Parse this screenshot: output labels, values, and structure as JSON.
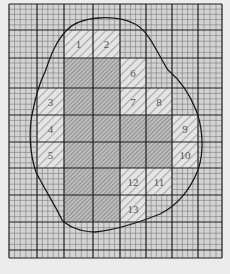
{
  "figure": {
    "grid": {
      "left": 9,
      "top": 4,
      "right": 222,
      "bottom": 258,
      "columns_x": [
        9,
        37,
        64,
        93,
        120,
        146,
        172,
        198,
        222
      ],
      "rows_y": [
        4,
        30,
        58,
        88,
        115,
        142,
        168,
        195,
        222,
        250,
        258
      ],
      "minor_divisions": 5
    },
    "colors": {
      "background": "#ececec",
      "paper": "#d4d4d4",
      "minor_line": "#7a7a7a",
      "major_line": "#1e1e1e",
      "outline": "#1a1a1a",
      "full_square_fill": "#bdbdbd",
      "partial_square_fill": "#e4e4e4",
      "hatch": "#8a8a8a",
      "label": "#555555"
    },
    "full_squares": [
      {
        "col": 2,
        "row": 2
      },
      {
        "col": 3,
        "row": 2
      },
      {
        "col": 2,
        "row": 3
      },
      {
        "col": 3,
        "row": 3
      },
      {
        "col": 2,
        "row": 4
      },
      {
        "col": 3,
        "row": 4
      },
      {
        "col": 4,
        "row": 4
      },
      {
        "col": 5,
        "row": 4
      },
      {
        "col": 2,
        "row": 5
      },
      {
        "col": 3,
        "row": 5
      },
      {
        "col": 4,
        "row": 5
      },
      {
        "col": 5,
        "row": 5
      },
      {
        "col": 2,
        "row": 6
      },
      {
        "col": 3,
        "row": 6
      },
      {
        "col": 2,
        "row": 7
      },
      {
        "col": 3,
        "row": 7
      }
    ],
    "partial_squares": [
      {
        "label": "1",
        "col": 2,
        "row": 1
      },
      {
        "label": "2",
        "col": 3,
        "row": 1
      },
      {
        "label": "3",
        "col": 1,
        "row": 3
      },
      {
        "label": "4",
        "col": 1,
        "row": 4
      },
      {
        "label": "5",
        "col": 1,
        "row": 5
      },
      {
        "label": "6",
        "col": 4,
        "row": 2
      },
      {
        "label": "7",
        "col": 4,
        "row": 3
      },
      {
        "label": "8",
        "col": 5,
        "row": 3
      },
      {
        "label": "9",
        "col": 6,
        "row": 4
      },
      {
        "label": "10",
        "col": 6,
        "row": 5
      },
      {
        "label": "11",
        "col": 5,
        "row": 6
      },
      {
        "label": "12",
        "col": 4,
        "row": 6
      },
      {
        "label": "13",
        "col": 4,
        "row": 7
      }
    ],
    "outline_path": "M 67 30 C 80 16, 115 14, 135 24 C 150 32, 158 55, 168 70 C 180 80, 190 95, 196 110 C 202 125, 205 150, 198 170 C 190 190, 178 205, 160 214 C 140 222, 115 230, 95 232 C 80 232, 68 226, 62 220 C 55 205, 45 190, 36 172 C 30 155, 28 130, 33 110 C 36 95, 40 82, 45 72 C 50 58, 55 42, 67 30 Z"
  }
}
